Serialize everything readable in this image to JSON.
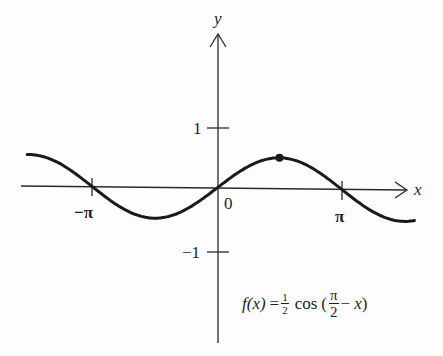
{
  "chart_data": {
    "type": "line",
    "title": "",
    "function_label": "f(x) = 1/2 cos(π/2 − x)",
    "formula": {
      "lhs": "f(x)",
      "equals": "=",
      "coef_num": "1",
      "coef_den": "2",
      "func": "cos",
      "open": "(",
      "arg_num": "π",
      "arg_den": "2",
      "minus": "−",
      "var": "x",
      "close": ")"
    },
    "xlabel": "x",
    "ylabel": "y",
    "x_ticks": [
      {
        "value": -3.14159,
        "label": "−π"
      },
      {
        "value": 0,
        "label": "0"
      },
      {
        "value": 3.14159,
        "label": "π"
      }
    ],
    "y_ticks": [
      {
        "value": 1,
        "label": "1"
      },
      {
        "value": -1,
        "label": "−1"
      }
    ],
    "xlim": [
      -4.8,
      6.6
    ],
    "ylim": [
      -2.5,
      2.5
    ],
    "grid": false,
    "legend": null,
    "series": [
      {
        "name": "f(x) = 1/2 cos(π/2 − x)",
        "amplitude": 0.5,
        "x": [
          -4.77,
          -3.93,
          -3.14,
          -2.36,
          -1.57,
          -0.79,
          0,
          0.79,
          1.57,
          2.36,
          3.14,
          3.93,
          4.71,
          4.96
        ],
        "y": [
          0.5,
          0.354,
          0,
          -0.354,
          -0.5,
          -0.354,
          0,
          0.354,
          0.5,
          0.354,
          0,
          -0.354,
          -0.5,
          -0.48
        ]
      }
    ],
    "annotations": [
      {
        "type": "point",
        "x": 1.5708,
        "y": 0.5,
        "label": "maximum at x = π/2"
      }
    ]
  },
  "labels": {
    "y_axis": "y",
    "x_axis": "x",
    "origin": "0",
    "neg_pi": "−π",
    "pi": "π",
    "one": "1",
    "neg_one": "−1"
  }
}
